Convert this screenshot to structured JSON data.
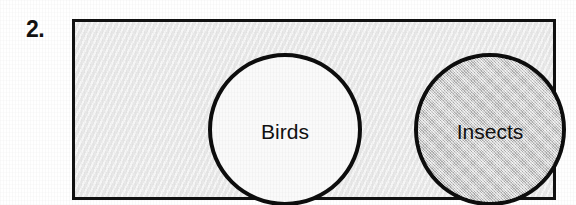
{
  "item": {
    "number_label": "2.",
    "type": "venn-diagram",
    "relationship": "disjoint"
  },
  "diagram": {
    "universe_label": "",
    "border_color": "#111111",
    "background_color": "#ebebeb",
    "sets": [
      {
        "id": "birds",
        "label": "Birds",
        "fill": "white",
        "fill_color": "#fafafa",
        "shaded": false,
        "outline_color": "#0d0d0d",
        "position": "left"
      },
      {
        "id": "insects",
        "label": "Insects",
        "fill": "gray-halftone",
        "fill_color": "#cfcfcf",
        "shaded": true,
        "outline_color": "#0d0d0d",
        "position": "right"
      }
    ]
  }
}
